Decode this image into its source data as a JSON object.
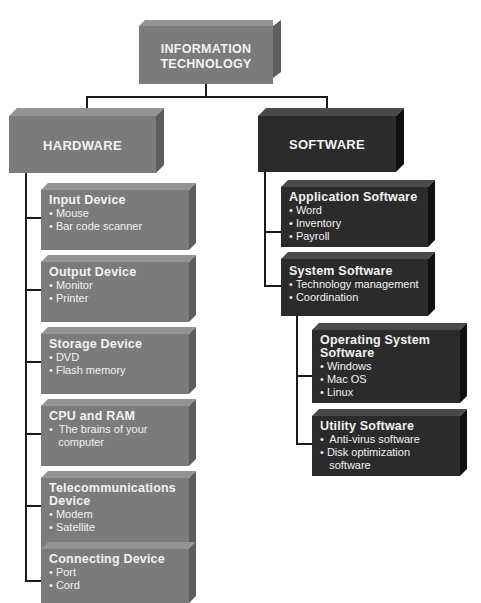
{
  "root": {
    "title_line1": "INFORMATION",
    "title_line2": "TECHNOLOGY"
  },
  "hardware": {
    "title": "HARDWARE",
    "children": [
      {
        "title": "Input Device",
        "items": [
          "• Mouse",
          "• Bar code scanner"
        ]
      },
      {
        "title": "Output Device",
        "items": [
          "• Monitor",
          "• Printer"
        ]
      },
      {
        "title": "Storage Device",
        "items": [
          "• DVD",
          "• Flash memory"
        ]
      },
      {
        "title": "CPU and RAM",
        "items": [
          "•  The brains of your",
          "   computer"
        ]
      },
      {
        "title": "Telecommunications",
        "title2": "Device",
        "items": [
          "• Modem",
          "• Satellite"
        ]
      },
      {
        "title": "Connecting Device",
        "items": [
          "• Port",
          "• Cord"
        ]
      }
    ]
  },
  "software": {
    "title": "SOFTWARE",
    "children": [
      {
        "title": "Application Software",
        "items": [
          "• Word",
          "• Inventory",
          "• Payroll"
        ]
      },
      {
        "title": "System Software",
        "items": [
          "• Technology management",
          "• Coordination"
        ]
      }
    ],
    "system_children": [
      {
        "title": "Operating System",
        "title2": "Software",
        "items": [
          "• Windows",
          "• Mac OS",
          "• Linux"
        ]
      },
      {
        "title": "Utility Software",
        "items": [
          "•  Anti-virus software",
          "• Disk optimization",
          "   software"
        ]
      }
    ]
  },
  "colors": {
    "hardware": "#7b7b7b",
    "software": "#2b2b2b",
    "connector": "#1a1a1a"
  }
}
